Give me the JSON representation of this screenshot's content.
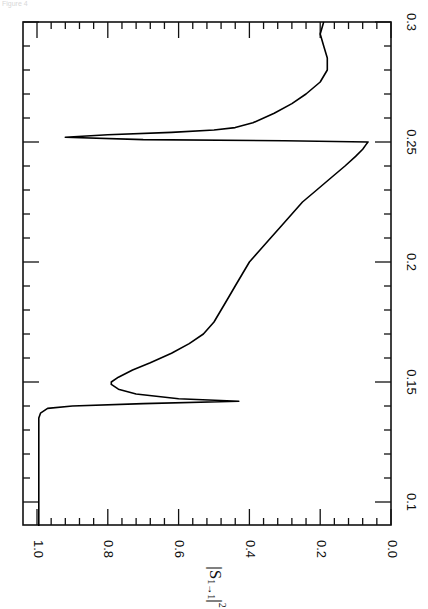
{
  "figure": {
    "corner_note": "Figure 4",
    "orientation": "rotated-90-clockwise"
  },
  "chart_data": {
    "type": "line",
    "title": "",
    "xlabel": "",
    "ylabel": "|S1→1|²",
    "ylabel_parts": {
      "main": "|S",
      "sub": "1→1",
      "tail": "|",
      "sup": "2"
    },
    "xlim": [
      0.09,
      0.3
    ],
    "ylim": [
      0.0,
      1.04
    ],
    "x_ticks": [
      0.1,
      0.15,
      0.2,
      0.25,
      0.3
    ],
    "x_tick_labels": [
      "0.1",
      "0.15",
      "0.2",
      "0.25",
      "0.3"
    ],
    "x_minor_step": 0.01,
    "y_ticks": [
      0.0,
      0.2,
      0.4,
      0.6,
      0.8,
      1.0
    ],
    "y_tick_labels": [
      "0.0",
      "0.2",
      "0.4",
      "0.6",
      "0.8",
      "1.0"
    ],
    "y_minor_step": 0.04,
    "grid": false,
    "legend": null,
    "series": [
      {
        "name": "|S1→1|²",
        "color": "#000000",
        "x": [
          0.09,
          0.1,
          0.11,
          0.12,
          0.13,
          0.135,
          0.137,
          0.139,
          0.14,
          0.141,
          0.142,
          0.143,
          0.145,
          0.147,
          0.149,
          0.15,
          0.152,
          0.155,
          0.158,
          0.162,
          0.166,
          0.17,
          0.175,
          0.18,
          0.185,
          0.19,
          0.195,
          0.2,
          0.205,
          0.21,
          0.215,
          0.22,
          0.225,
          0.23,
          0.235,
          0.24,
          0.244,
          0.247,
          0.249,
          0.25,
          0.2505,
          0.251,
          0.252,
          0.253,
          0.254,
          0.255,
          0.256,
          0.258,
          0.262,
          0.266,
          0.27,
          0.275,
          0.28,
          0.285,
          0.29,
          0.295,
          0.3
        ],
        "y": [
          0.995,
          0.995,
          0.995,
          0.995,
          0.995,
          0.995,
          0.99,
          0.97,
          0.9,
          0.7,
          0.43,
          0.6,
          0.72,
          0.77,
          0.79,
          0.79,
          0.77,
          0.73,
          0.68,
          0.62,
          0.57,
          0.53,
          0.5,
          0.48,
          0.46,
          0.44,
          0.42,
          0.4,
          0.37,
          0.34,
          0.31,
          0.28,
          0.25,
          0.21,
          0.17,
          0.13,
          0.1,
          0.08,
          0.07,
          0.065,
          0.3,
          0.7,
          0.92,
          0.8,
          0.62,
          0.5,
          0.44,
          0.39,
          0.33,
          0.28,
          0.24,
          0.2,
          0.18,
          0.18,
          0.19,
          0.2,
          0.19
        ]
      }
    ],
    "annotations": [
      {
        "text": "sharp dip near x=0.142 to ~0.43"
      },
      {
        "text": "minimum ~0.065 at x=0.25 followed by peak ~0.92 at x≈0.252"
      }
    ]
  }
}
